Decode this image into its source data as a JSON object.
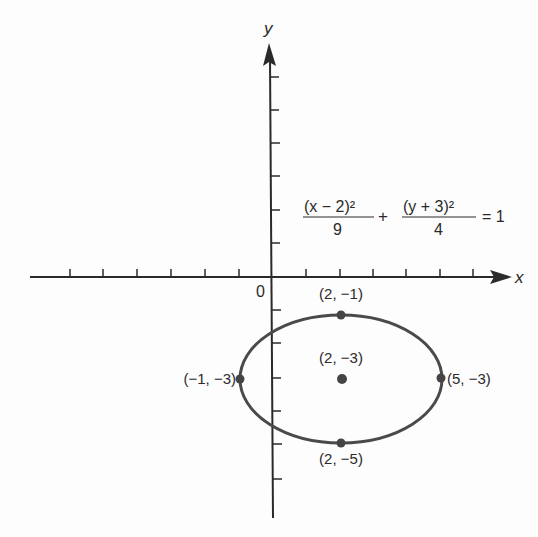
{
  "figure": {
    "type": "ellipse-graph",
    "axes": {
      "x_label": "x",
      "y_label": "y",
      "origin_label": "0",
      "x_range": [
        -7,
        7
      ],
      "y_range": [
        -7,
        7
      ],
      "tick_spacing": 1
    },
    "equation": {
      "term1_numerator": "(x − 2)²",
      "term1_denominator": "9",
      "plus": "+",
      "term2_numerator": "(y + 3)²",
      "term2_denominator": "4",
      "equals": "= 1"
    },
    "ellipse": {
      "center": [
        2,
        -3
      ],
      "semi_major_x": 3,
      "semi_minor_y": 2
    },
    "points": [
      {
        "label": "(2, −1)",
        "x": 2,
        "y": -1,
        "role": "top-vertex"
      },
      {
        "label": "(2, −3)",
        "x": 2,
        "y": -3,
        "role": "center"
      },
      {
        "label": "(−1, −3)",
        "x": -1,
        "y": -3,
        "role": "left-vertex"
      },
      {
        "label": "(5, −3)",
        "x": 5,
        "y": -3,
        "role": "right-vertex"
      },
      {
        "label": "(2, −5)",
        "x": 2,
        "y": -5,
        "role": "bottom-vertex"
      }
    ],
    "colors": {
      "axis": "#2a2a2a",
      "ellipse": "#4a4a4a",
      "point": "#444444",
      "background": "#fdfdfd"
    }
  }
}
